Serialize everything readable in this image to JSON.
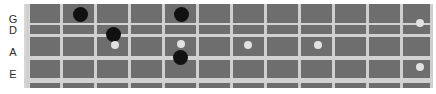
{
  "diagram": {
    "instrument": "bass-guitar",
    "string_labels": [
      "G",
      "D",
      "A",
      "E"
    ],
    "fret_count": 12,
    "legend": {
      "root_marker": "black-dot",
      "scale_marker": "light-dot"
    },
    "colors": {
      "board": "#6e6e6e",
      "fret_wire": "#cfcfcf",
      "string": "#d2d2d2",
      "nut": "#d8d8d8",
      "root_dot": "#111111",
      "scale_dot": "#e2e2e2",
      "label_text": "#2b2b2b",
      "background": "#ffffff"
    }
  },
  "strings": [
    {
      "name": "G",
      "y": 23
    },
    {
      "name": "D",
      "y": 34
    },
    {
      "name": "A",
      "y": 56
    },
    {
      "name": "E",
      "y": 78
    }
  ],
  "frets": [
    {
      "index": 1,
      "x": 26
    },
    {
      "index": 2,
      "x": 60
    },
    {
      "index": 3,
      "x": 94
    },
    {
      "index": 4,
      "x": 128
    },
    {
      "index": 5,
      "x": 162
    },
    {
      "index": 6,
      "x": 196
    },
    {
      "index": 7,
      "x": 230
    },
    {
      "index": 8,
      "x": 264
    },
    {
      "index": 9,
      "x": 298
    },
    {
      "index": 10,
      "x": 332
    },
    {
      "index": 11,
      "x": 366
    },
    {
      "index": 12,
      "x": 400
    },
    {
      "index": 13,
      "x": 430
    }
  ],
  "notes": [
    {
      "id": "n1",
      "string": "G",
      "fret": 2,
      "type": "root",
      "x": 80,
      "y": 14
    },
    {
      "id": "n2",
      "string": "D",
      "fret": 3,
      "type": "root",
      "x": 113,
      "y": 34
    },
    {
      "id": "n3",
      "string": "D",
      "fret": 3,
      "type": "scale",
      "x": 115,
      "y": 45
    },
    {
      "id": "n4",
      "string": "G",
      "fret": 5,
      "type": "root",
      "x": 181,
      "y": 14
    },
    {
      "id": "n5",
      "string": "D",
      "fret": 5,
      "type": "scale",
      "x": 181,
      "y": 44
    },
    {
      "id": "n6",
      "string": "A",
      "fret": 5,
      "type": "root",
      "x": 180,
      "y": 57
    },
    {
      "id": "n7",
      "string": "A",
      "fret": 7,
      "type": "scale",
      "x": 248,
      "y": 45
    },
    {
      "id": "n8",
      "string": "A",
      "fret": 9,
      "type": "scale",
      "x": 318,
      "y": 45
    },
    {
      "id": "n9",
      "string": "D",
      "fret": 12,
      "type": "scale",
      "x": 420,
      "y": 23
    },
    {
      "id": "n10",
      "string": "E",
      "fret": 12,
      "type": "scale",
      "x": 420,
      "y": 67
    }
  ]
}
